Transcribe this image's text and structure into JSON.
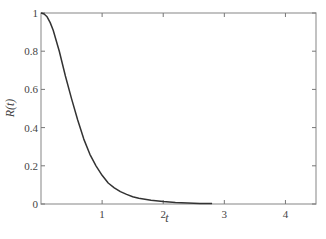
{
  "chart_data": {
    "type": "line",
    "title": "",
    "xlabel": "t",
    "ylabel": "R(t)",
    "xlim": [
      0,
      4.5
    ],
    "ylim": [
      0,
      1
    ],
    "grid": false,
    "legend": null,
    "x_ticks": [
      1,
      2,
      3,
      4
    ],
    "x_tick_labels": [
      "1",
      "2",
      "3",
      "4"
    ],
    "y_ticks": [
      0,
      0.2,
      0.4,
      0.6,
      0.8,
      1
    ],
    "y_tick_labels": [
      "0",
      "0.2",
      "0.4",
      "0.6",
      "0.8",
      "1"
    ],
    "series": [
      {
        "name": "R(t)",
        "color": "#333333",
        "x": [
          0,
          0.05,
          0.1,
          0.15,
          0.2,
          0.3,
          0.4,
          0.5,
          0.6,
          0.7,
          0.8,
          0.9,
          1.0,
          1.1,
          1.2,
          1.3,
          1.4,
          1.5,
          1.6,
          1.8,
          2.0,
          2.2,
          2.4,
          2.6,
          2.8
        ],
        "y": [
          1.0,
          0.995,
          0.98,
          0.95,
          0.91,
          0.8,
          0.67,
          0.55,
          0.44,
          0.34,
          0.26,
          0.2,
          0.15,
          0.11,
          0.085,
          0.065,
          0.05,
          0.038,
          0.03,
          0.02,
          0.013,
          0.008,
          0.005,
          0.003,
          0.002
        ]
      }
    ]
  }
}
